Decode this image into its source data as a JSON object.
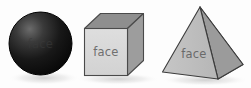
{
  "illustration": {
    "title": "Faces of three-dimensional shapes",
    "background_color": "#fdfdfd",
    "width": 251,
    "height": 88
  },
  "labels": {
    "sphere_face": "face",
    "cube_face": "face",
    "pyramid_face": "face"
  },
  "shapes": [
    {
      "name": "sphere",
      "label": "face",
      "fill_light": "#5a5a5a",
      "fill_dark": "#0d0d0d",
      "outline": "#000000",
      "center_x": 40,
      "center_y": 44,
      "radius": 32
    },
    {
      "name": "cube",
      "label": "face",
      "front_fill": "#d9d9d9",
      "top_fill": "#8e8e8e",
      "side_fill": "#9d9d9d",
      "outline": "#4a4a4a"
    },
    {
      "name": "pyramid",
      "label": "face",
      "left_fill": "#c2c2c2",
      "right_fill": "#9b9b9b",
      "base_fill": "#8a8a8a",
      "outline": "#3c3c3c"
    }
  ],
  "colors": {
    "shadow": "#e6e6e6",
    "label_grey": "#6f6f6f",
    "canvas": "#fdfdfd"
  }
}
